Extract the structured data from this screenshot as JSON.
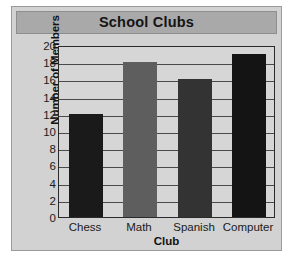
{
  "chart_data": {
    "type": "bar",
    "title": "School Clubs",
    "xlabel": "Club",
    "ylabel": "Number of Members",
    "categories": [
      "Chess",
      "Math",
      "Spanish",
      "Computer"
    ],
    "values": [
      12,
      18,
      16,
      19
    ],
    "ylim": [
      0,
      20
    ],
    "ytick_step": 2,
    "yticks": [
      20,
      18,
      16,
      14,
      12,
      10,
      8,
      6,
      4,
      2,
      0
    ],
    "grid": true,
    "grid_axis": "y",
    "legend": false,
    "bar_colors": [
      "#1a1a1a",
      "#5e5e5e",
      "#333333",
      "#141414"
    ],
    "plot_background": "#d6d6d6",
    "panel_background": "#d2d2d2",
    "title_band_color": "#a9a9a9",
    "axis_color": "#2a2a2a",
    "gridline_color": "#4a4a4a"
  }
}
